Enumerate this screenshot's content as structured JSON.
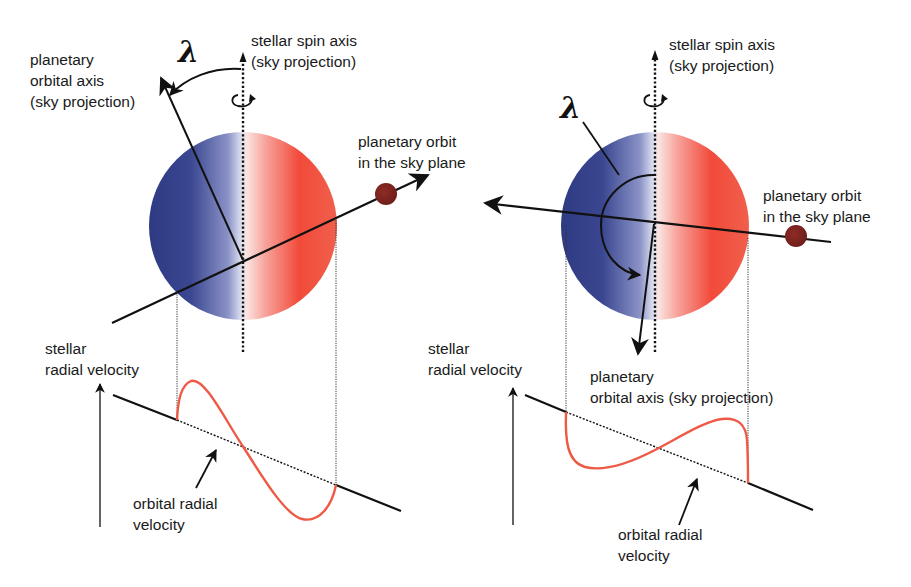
{
  "figure": {
    "symbol": "λ",
    "colors": {
      "blueshift": "#323f86",
      "redshift": "#f0392a",
      "planet": "#7a2220",
      "rv_curve": "#ee5a45",
      "line": "#111111"
    },
    "left_panel": {
      "spin_axis_label": [
        "stellar spin axis",
        "(sky projection)"
      ],
      "orbital_axis_label": [
        "planetary",
        "orbital axis",
        "(sky projection)"
      ],
      "orbit_label": [
        "planetary orbit",
        "in the sky plane"
      ],
      "stellar_rv_label": [
        "stellar",
        "radial velocity"
      ],
      "orbital_rv_label": [
        "orbital radial",
        "velocity"
      ],
      "lambda_description": "small misalignment (aligned prograde orbit)"
    },
    "right_panel": {
      "spin_axis_label": [
        "stellar spin axis",
        "(sky projection)"
      ],
      "orbital_axis_label": [
        "planetary",
        "orbital axis (sky projection)"
      ],
      "orbit_label": [
        "planetary orbit",
        "in the sky plane"
      ],
      "stellar_rv_label": [
        "stellar",
        "radial velocity"
      ],
      "orbital_rv_label": [
        "orbital radial",
        "velocity"
      ],
      "lambda_description": "large misalignment (retrograde orbit)"
    }
  }
}
